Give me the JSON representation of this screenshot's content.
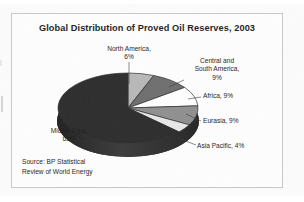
{
  "chart_data": {
    "type": "pie",
    "title": "Global Distribution of Proved Oil Reserves, 2003",
    "xlabel": "",
    "ylabel": "",
    "grid": false,
    "legend_position": "none",
    "labels_outside": true,
    "three_d": true,
    "categories": [
      "North America",
      "Central and South America",
      "Africa",
      "Eurasia",
      "Asia Pacific",
      "Middle East"
    ],
    "values": [
      6,
      9,
      9,
      9,
      4,
      63
    ],
    "unit": "%",
    "slices": [
      {
        "name": "North America",
        "value": 6,
        "label": "North America,\n6%",
        "color": "#b8b8b8"
      },
      {
        "name": "Central and South America",
        "value": 9,
        "label": "Central and\nSouth America,\n9%",
        "color": "#6e6e6e"
      },
      {
        "name": "Africa",
        "value": 9,
        "label": "Africa, 9%",
        "color": "#ffffff"
      },
      {
        "name": "Eurasia",
        "value": 9,
        "label": "Eurasia, 9%",
        "color": "#8f8f8f"
      },
      {
        "name": "Asia Pacific",
        "value": 4,
        "label": "Asia Pacific, 4%",
        "color": "#e8e8e8"
      },
      {
        "name": "Middle East",
        "value": 63,
        "label": "Middle East,\n63%",
        "color": "#2b2b2b"
      }
    ],
    "annotations": [
      "Source: BP Statistical",
      "Review of World Energy"
    ]
  },
  "labels": {
    "north_america": "North America,\n6%",
    "central_south_america": "Central and\nSouth America,\n9%",
    "africa": "Africa, 9%",
    "eurasia": "Eurasia, 9%",
    "asia_pacific": "Asia Pacific, 4%",
    "middle_east": "Middle East,\n63%"
  },
  "source": {
    "text": "Source: BP Statistical\nReview of World Energy"
  },
  "colors": {
    "frame": "#c9c9c9",
    "text": "#1c1c1c",
    "pie_dark": "#2b2b2b",
    "pie_light": "#b8b8b8",
    "pie_white": "#ffffff",
    "pie_mid": "#6e6e6e",
    "pie_gray": "#8f8f8f",
    "pie_pale": "#e8e8e8",
    "background": "#ffffff"
  }
}
